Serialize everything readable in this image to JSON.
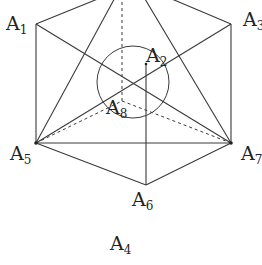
{
  "diagram": {
    "type": "cube-projection",
    "colors": {
      "stroke": "#3a3a3a",
      "text": "#222222",
      "background": "#ffffff"
    },
    "vertices": {
      "A1": {
        "label": "A",
        "sub": "1",
        "x": 36,
        "y": 24,
        "lx": 6,
        "ly": 30
      },
      "A2": {
        "label": "A",
        "sub": "2",
        "x": 146,
        "y": 64,
        "lx": 146,
        "ly": 62
      },
      "A3": {
        "label": "A",
        "sub": "3",
        "x": 231,
        "y": 24,
        "lx": 243,
        "ly": 26
      },
      "A5": {
        "label": "A",
        "sub": "5",
        "x": 36,
        "y": 143,
        "lx": 10,
        "ly": 160
      },
      "A6": {
        "label": "A",
        "sub": "6",
        "x": 146,
        "y": 185,
        "lx": 132,
        "ly": 206
      },
      "A7": {
        "label": "A",
        "sub": "7",
        "x": 231,
        "y": 143,
        "lx": 241,
        "ly": 160
      },
      "A8": {
        "label": "A",
        "sub": "8",
        "x": 122,
        "y": 101,
        "lx": 106,
        "ly": 114
      },
      "A4": {
        "label": "A",
        "sub": "4",
        "x": 122,
        "y": 248,
        "lx": 110,
        "ly": 250
      }
    },
    "circle": {
      "cx": 133,
      "cy": 82,
      "r": 36
    }
  }
}
